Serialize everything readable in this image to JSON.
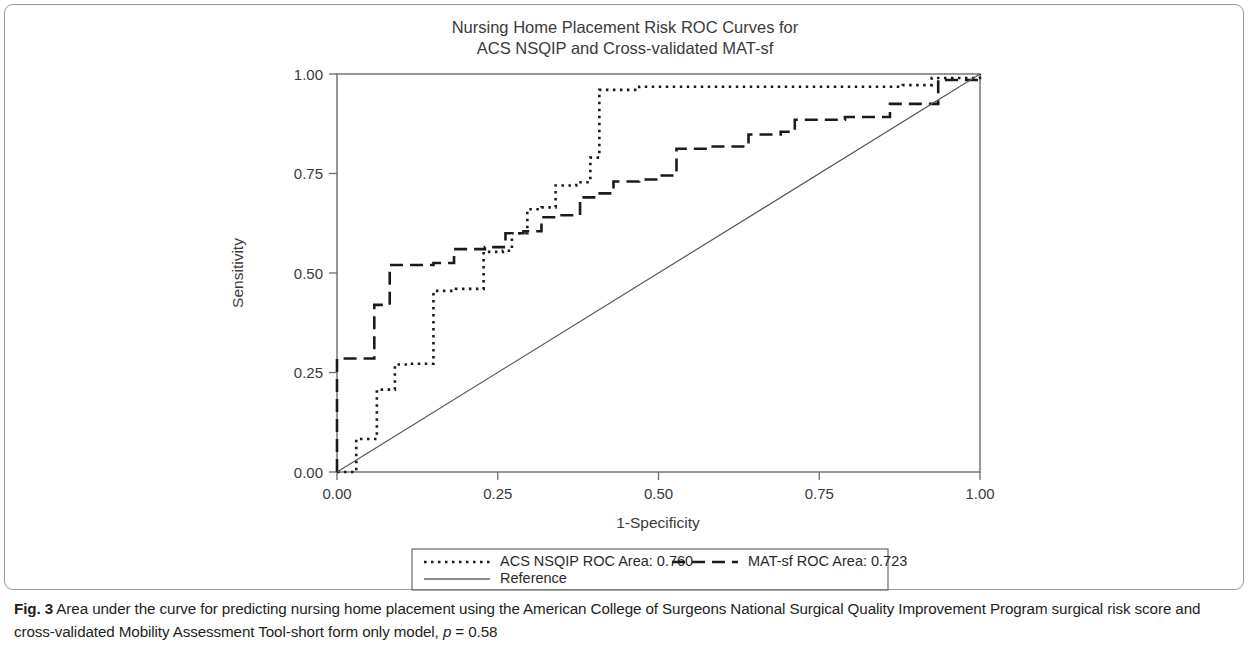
{
  "figure": {
    "title_line1": "Nursing Home Placement Risk ROC Curves for",
    "title_line2": "ACS NSQIP and Cross-validated MAT-sf",
    "caption_label": "Fig. 3",
    "caption_text_part1": " Area under the curve for predicting nursing home placement using the American College of Surgeons National Surgical Quality Improvement Program surgical risk score and cross-validated Mobility Assessment Tool-short form only model, ",
    "caption_p_symbol": "p",
    "caption_p_value": " = 0.58"
  },
  "chart_data": {
    "type": "line",
    "title": "Nursing Home Placement Risk ROC Curves for ACS NSQIP and Cross-validated MAT-sf",
    "xlabel": "1-Specificity",
    "ylabel": "Sensitivity",
    "xlim": [
      0,
      1
    ],
    "ylim": [
      0,
      1
    ],
    "xticks": [
      "0.00",
      "0.25",
      "0.50",
      "0.75",
      "1.00"
    ],
    "xtick_values": [
      0,
      0.25,
      0.5,
      0.75,
      1.0
    ],
    "yticks": [
      "0.00",
      "0.25",
      "0.50",
      "0.75",
      "1.00"
    ],
    "ytick_values": [
      0,
      0.25,
      0.5,
      0.75,
      1.0
    ],
    "grid": false,
    "legend_position": "below-axes",
    "series": [
      {
        "name": "ACS NSQIP ROC Area: 0.760",
        "style": "dotted",
        "color": "#1a1a1a",
        "points": [
          [
            0.0,
            0.0
          ],
          [
            0.03,
            0.0
          ],
          [
            0.03,
            0.083
          ],
          [
            0.062,
            0.083
          ],
          [
            0.062,
            0.207
          ],
          [
            0.09,
            0.207
          ],
          [
            0.09,
            0.27
          ],
          [
            0.11,
            0.27
          ],
          [
            0.11,
            0.272
          ],
          [
            0.15,
            0.272
          ],
          [
            0.15,
            0.455
          ],
          [
            0.185,
            0.455
          ],
          [
            0.185,
            0.46
          ],
          [
            0.228,
            0.46
          ],
          [
            0.228,
            0.553
          ],
          [
            0.258,
            0.553
          ],
          [
            0.258,
            0.556
          ],
          [
            0.272,
            0.556
          ],
          [
            0.272,
            0.6
          ],
          [
            0.296,
            0.6
          ],
          [
            0.296,
            0.66
          ],
          [
            0.318,
            0.66
          ],
          [
            0.318,
            0.665
          ],
          [
            0.34,
            0.665
          ],
          [
            0.34,
            0.72
          ],
          [
            0.372,
            0.72
          ],
          [
            0.372,
            0.728
          ],
          [
            0.394,
            0.728
          ],
          [
            0.394,
            0.79
          ],
          [
            0.408,
            0.79
          ],
          [
            0.408,
            0.96
          ],
          [
            0.47,
            0.96
          ],
          [
            0.47,
            0.968
          ],
          [
            0.88,
            0.968
          ],
          [
            0.88,
            0.972
          ],
          [
            0.925,
            0.972
          ],
          [
            0.925,
            0.99
          ],
          [
            1.0,
            0.99
          ],
          [
            1.0,
            1.0
          ]
        ]
      },
      {
        "name": "MAT-sf ROC Area: 0.723",
        "style": "dashed",
        "color": "#1a1a1a",
        "points": [
          [
            0.0,
            0.0
          ],
          [
            0.0,
            0.285
          ],
          [
            0.058,
            0.285
          ],
          [
            0.058,
            0.42
          ],
          [
            0.082,
            0.42
          ],
          [
            0.082,
            0.52
          ],
          [
            0.15,
            0.52
          ],
          [
            0.15,
            0.525
          ],
          [
            0.182,
            0.525
          ],
          [
            0.182,
            0.56
          ],
          [
            0.23,
            0.56
          ],
          [
            0.23,
            0.565
          ],
          [
            0.262,
            0.565
          ],
          [
            0.262,
            0.6
          ],
          [
            0.29,
            0.6
          ],
          [
            0.29,
            0.605
          ],
          [
            0.318,
            0.605
          ],
          [
            0.318,
            0.64
          ],
          [
            0.346,
            0.64
          ],
          [
            0.346,
            0.645
          ],
          [
            0.378,
            0.645
          ],
          [
            0.378,
            0.69
          ],
          [
            0.402,
            0.69
          ],
          [
            0.402,
            0.7
          ],
          [
            0.43,
            0.7
          ],
          [
            0.43,
            0.73
          ],
          [
            0.47,
            0.73
          ],
          [
            0.47,
            0.735
          ],
          [
            0.5,
            0.735
          ],
          [
            0.5,
            0.745
          ],
          [
            0.528,
            0.745
          ],
          [
            0.528,
            0.812
          ],
          [
            0.578,
            0.812
          ],
          [
            0.578,
            0.818
          ],
          [
            0.64,
            0.818
          ],
          [
            0.64,
            0.848
          ],
          [
            0.69,
            0.848
          ],
          [
            0.69,
            0.855
          ],
          [
            0.712,
            0.855
          ],
          [
            0.712,
            0.885
          ],
          [
            0.79,
            0.885
          ],
          [
            0.79,
            0.892
          ],
          [
            0.86,
            0.892
          ],
          [
            0.86,
            0.925
          ],
          [
            0.935,
            0.925
          ],
          [
            0.935,
            0.985
          ],
          [
            1.0,
            0.985
          ],
          [
            1.0,
            1.0
          ]
        ]
      },
      {
        "name": "Reference",
        "style": "solid",
        "color": "#555555",
        "points": [
          [
            0.0,
            0.0
          ],
          [
            1.0,
            1.0
          ]
        ]
      }
    ],
    "legend": [
      {
        "label": "ACS NSQIP ROC Area: 0.760",
        "style": "dotted"
      },
      {
        "label": "MAT-sf ROC Area: 0.723",
        "style": "dashed"
      },
      {
        "label": "Reference",
        "style": "solid"
      }
    ]
  }
}
